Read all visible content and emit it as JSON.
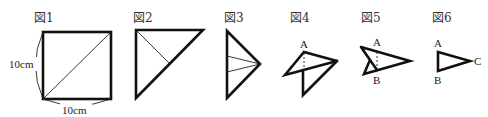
{
  "figures": [
    {
      "id": "fig1",
      "label": "図1",
      "description": "Square sheet with one diagonal",
      "dimensions": {
        "left": "10cm",
        "bottom": "10cm"
      }
    },
    {
      "id": "fig2",
      "label": "図2",
      "description": "Square folded along diagonal into right triangle with crease line to hypotenuse midpoint"
    },
    {
      "id": "fig3",
      "label": "図3",
      "description": "Folded into narrower triangle with two crease lines meeting at the tip"
    },
    {
      "id": "fig4",
      "label": "図4",
      "description": "Partially unfolded shape with point A and dashed crease",
      "points": {
        "A": "A"
      }
    },
    {
      "id": "fig5",
      "label": "図5",
      "description": "Arrow-like folded shape with points A and B and dashed crease",
      "points": {
        "A": "A",
        "B": "B"
      }
    },
    {
      "id": "fig6",
      "label": "図6",
      "description": "Final triangle ABC",
      "points": {
        "A": "A",
        "B": "B",
        "C": "C"
      }
    }
  ],
  "colors": {
    "stroke": "#111111",
    "text": "#333333",
    "background": "#ffffff"
  }
}
